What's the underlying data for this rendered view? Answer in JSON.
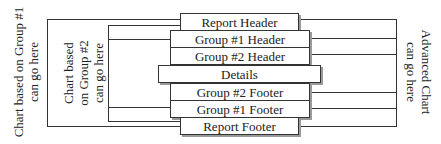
{
  "sections": [
    {
      "id": "report-header",
      "label": "Report Header"
    },
    {
      "id": "group1-header",
      "label": "Group #1 Header"
    },
    {
      "id": "group2-header",
      "label": "Group #2 Header"
    },
    {
      "id": "details",
      "label": "Details"
    },
    {
      "id": "group2-footer",
      "label": "Group #2 Footer"
    },
    {
      "id": "group1-footer",
      "label": "Group #1 Footer"
    },
    {
      "id": "report-footer",
      "label": "Report Footer"
    }
  ],
  "labels": {
    "left_outer": [
      "Chart based on Group #1",
      "can go here"
    ],
    "left_inner": [
      "Chart based",
      "on Group #2",
      "can go here"
    ],
    "right": [
      "Advanced Chart",
      "can go here"
    ]
  }
}
